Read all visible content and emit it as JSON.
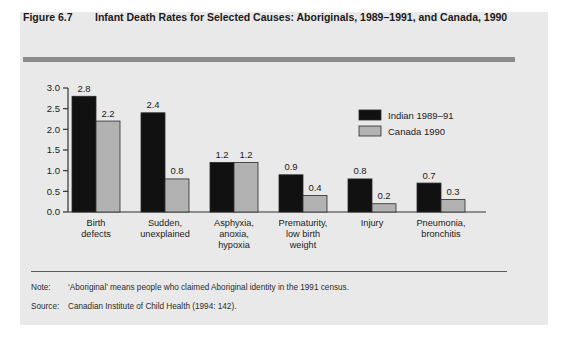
{
  "figure": {
    "number": "Figure 6.7",
    "title": "Infant Death Rates for Selected Causes: Aboriginals, 1989–1991, and Canada, 1990"
  },
  "footnotes": {
    "note_label": "Note:",
    "note_text": "‘Aboriginal’ means people who claimed Aboriginal identity in the 1991 census.",
    "source_label": "Source:",
    "source_text": "Canadian Institute of Child Health (1994: 142)."
  },
  "colors": {
    "panel_background": "#e9e9e9",
    "header_rule": "#8a8a8a",
    "series_indian": "#111111",
    "series_canada": "#b2b2b2",
    "axis": "#333333",
    "text": "#1b1b1b"
  },
  "chart_data": {
    "type": "bar",
    "title": "Infant Death Rates for Selected Causes: Aboriginals, 1989–1991, and Canada, 1990",
    "xlabel": "",
    "ylabel": "",
    "ylim": [
      0.0,
      3.0
    ],
    "ytick_labels": [
      "0.0",
      "0.5",
      "1.0",
      "1.5",
      "2.0",
      "2.5",
      "3.0"
    ],
    "ytick_values": [
      0.0,
      0.5,
      1.0,
      1.5,
      2.0,
      2.5,
      3.0
    ],
    "grid": false,
    "legend_position": "upper-right",
    "data_labels": true,
    "categories": [
      "Birth defects",
      "Sudden, unexplained",
      "Asphyxia, anoxia, hypoxia",
      "Prematurity, low birth weight",
      "Injury",
      "Pneumonia, bronchitis"
    ],
    "category_lines": [
      [
        "Birth",
        "defects"
      ],
      [
        "Sudden,",
        "unexplained"
      ],
      [
        "Asphyxia,",
        "anoxia,",
        "hypoxia"
      ],
      [
        "Prematurity,",
        "low birth",
        "weight"
      ],
      [
        "Injury"
      ],
      [
        "Pneumonia,",
        "bronchitis"
      ]
    ],
    "series": [
      {
        "name": "Indian 1989–91",
        "color": "#111111",
        "values": [
          2.8,
          2.4,
          1.2,
          0.9,
          0.8,
          0.7
        ],
        "labels": [
          "2.8",
          "2.4",
          "1.2",
          "0.9",
          "0.8",
          "0.7"
        ]
      },
      {
        "name": "Canada 1990",
        "color": "#b2b2b2",
        "values": [
          2.2,
          0.8,
          1.2,
          0.4,
          0.2,
          0.3
        ],
        "labels": [
          "2.2",
          "0.8",
          "1.2",
          "0.4",
          "0.2",
          "0.3"
        ]
      }
    ]
  }
}
